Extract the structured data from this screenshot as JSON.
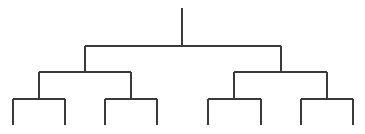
{
  "diagram": {
    "type": "binary-tree-dendrogram",
    "width": 365,
    "height": 134,
    "stroke_color": "#3a3a3a",
    "labels": [],
    "root": {
      "x": 182,
      "stem_top": 8,
      "bar_y": 46,
      "children": [
        {
          "x": 85,
          "bar_y": 72,
          "children": [
            {
              "x": 39,
              "bar_y": 99,
              "children": [
                {
                  "x": 13,
                  "bottom": 125
                },
                {
                  "x": 65,
                  "bottom": 125
                }
              ]
            },
            {
              "x": 131,
              "bar_y": 99,
              "children": [
                {
                  "x": 105,
                  "bottom": 125
                },
                {
                  "x": 157,
                  "bottom": 125
                }
              ]
            }
          ]
        },
        {
          "x": 281,
          "bar_y": 72,
          "children": [
            {
              "x": 234,
              "bar_y": 99,
              "children": [
                {
                  "x": 208,
                  "bottom": 125
                },
                {
                  "x": 261,
                  "bottom": 125
                }
              ]
            },
            {
              "x": 327,
              "bar_y": 99,
              "children": [
                {
                  "x": 301,
                  "bottom": 125
                },
                {
                  "x": 353,
                  "bottom": 125
                }
              ]
            }
          ]
        }
      ]
    }
  }
}
